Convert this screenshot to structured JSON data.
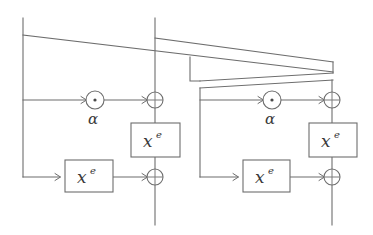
{
  "figure": {
    "title": "",
    "type": "block-cipher-round-diagram",
    "background_color": "#ffffff",
    "line_color": "#6d6d6d",
    "text_color": "#3a3a3a",
    "width": 373,
    "height": 235
  },
  "labels": {
    "alpha": "α",
    "x_base": "x",
    "x_exponent": "e"
  },
  "blocks": [
    {
      "id": "round-left",
      "alpha_multiplier": {
        "symbol": "α",
        "cx": 95,
        "cy": 100,
        "r": 9,
        "dot_r": 1.6
      },
      "xor_upper": {
        "cx": 155,
        "cy": 100,
        "r": 8
      },
      "xor_lower": {
        "cx": 155,
        "cy": 177,
        "r": 8
      },
      "pow_box_upper": {
        "x": 131,
        "y": 123,
        "w": 49,
        "h": 34,
        "label_base": "x",
        "label_exp": "e"
      },
      "pow_box_lower": {
        "x": 65,
        "y": 160,
        "w": 48,
        "h": 32,
        "label_base": "x",
        "label_exp": "e"
      },
      "rail_left_x": 23,
      "rail_right_x": 155,
      "rail_top_y": 18,
      "rail_bottom_y": 225
    },
    {
      "id": "round-right",
      "alpha_multiplier": {
        "symbol": "α",
        "cx": 272,
        "cy": 100,
        "r": 9,
        "dot_r": 1.6
      },
      "xor_upper": {
        "cx": 332,
        "cy": 100,
        "r": 8
      },
      "xor_lower": {
        "cx": 332,
        "cy": 177,
        "r": 8
      },
      "pow_box_upper": {
        "x": 309,
        "y": 123,
        "w": 48,
        "h": 34,
        "label_base": "x",
        "label_exp": "e"
      },
      "pow_box_lower": {
        "x": 243,
        "y": 160,
        "w": 47,
        "h": 32,
        "label_base": "x",
        "label_exp": "e"
      },
      "rail_left_x": 200,
      "rail_right_x": 332,
      "rail_top_y": 88,
      "rail_bottom_y": 225
    }
  ],
  "crossing_wires": [
    {
      "id": "feed-left-to-far-right-upper",
      "from_x": 23,
      "from_y": 35,
      "to_x": 333,
      "to_y": 72
    },
    {
      "id": "feed-mid-to-far-right",
      "from_x": 155,
      "from_y": 38,
      "to_x": 333,
      "to_y": 62
    }
  ]
}
